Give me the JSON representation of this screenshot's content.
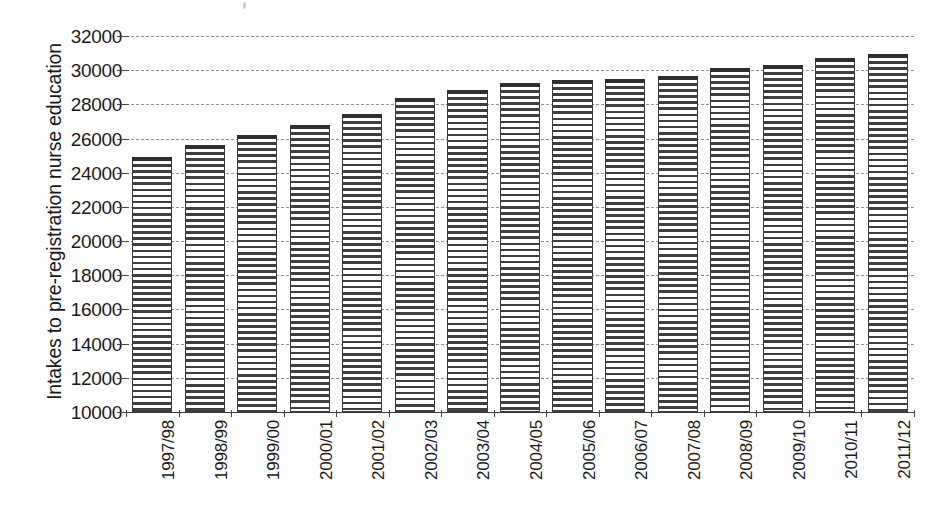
{
  "chart_data": {
    "type": "bar",
    "title": "",
    "subtitle": "",
    "xlabel": "",
    "ylabel": "Intakes to pre-registration nurse education",
    "ylim": [
      10000,
      32000
    ],
    "ytick_step": 2000,
    "ytick_labels": [
      "32000",
      "30000",
      "28000",
      "26000",
      "24000",
      "22000",
      "20000",
      "18000",
      "16000",
      "14000",
      "12000",
      "10000"
    ],
    "ytick_values": [
      32000,
      30000,
      28000,
      26000,
      24000,
      22000,
      20000,
      18000,
      16000,
      14000,
      12000,
      10000
    ],
    "grid": true,
    "grid_axis": "y",
    "grid_style": "dashed",
    "legend": "none",
    "series_name": "Intakes",
    "bar_fill": "horizontal-line-hatch",
    "bar_color": "#3f3f3f",
    "categories": [
      "1997/98",
      "1998/99",
      "1999/00",
      "2000/01",
      "2001/02",
      "2002/03",
      "2003/04",
      "2004/05",
      "2005/06",
      "2006/07",
      "2007/08",
      "2008/09",
      "2009/10",
      "2010/11",
      "2011/12"
    ],
    "values": [
      24900,
      25600,
      26200,
      26800,
      27450,
      28350,
      28850,
      29250,
      29400,
      29500,
      29650,
      30100,
      30300,
      30700,
      30950
    ]
  },
  "axis": {
    "y_title": "Intakes to pre-registration nurse education"
  }
}
